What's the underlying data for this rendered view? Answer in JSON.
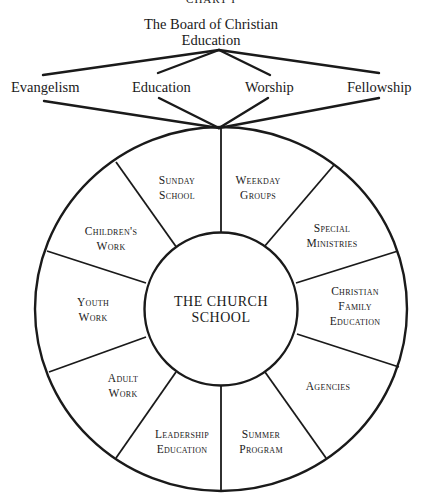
{
  "chart": {
    "header_label": "CHART I",
    "board": {
      "line1": "The Board of Christian",
      "line2": "Education"
    },
    "functions": [
      {
        "label": "Evangelism"
      },
      {
        "label": "Education"
      },
      {
        "label": "Worship"
      },
      {
        "label": "Fellowship"
      }
    ],
    "center": {
      "line1": "THE CHURCH",
      "line2": "SCHOOL"
    },
    "segments": [
      {
        "line1": "Sunday",
        "line2": "School"
      },
      {
        "line1": "Weekday",
        "line2": "Groups"
      },
      {
        "line1": "Special",
        "line2": "Ministries"
      },
      {
        "line1": "Christian",
        "line2": "Family",
        "line3": "Education"
      },
      {
        "line1": "Agencies"
      },
      {
        "line1": "Summer",
        "line2": "Program"
      },
      {
        "line1": "Leadership",
        "line2": "Education"
      },
      {
        "line1": "Adult",
        "line2": "Work"
      },
      {
        "line1": "Youth",
        "line2": "Work"
      },
      {
        "line1": "Children's",
        "line2": "Work"
      }
    ],
    "colors": {
      "ink": "#1a1a1a",
      "paper": "#ffffff"
    }
  }
}
